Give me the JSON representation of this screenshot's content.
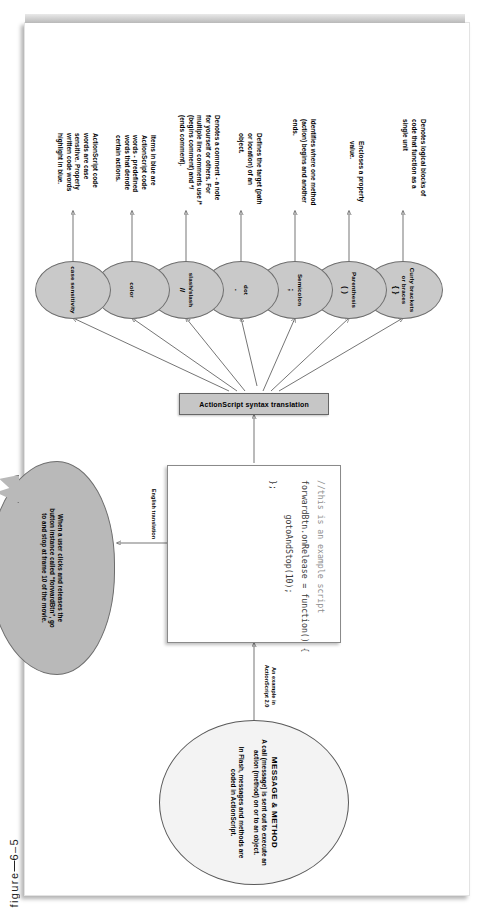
{
  "figure": {
    "caption_label": "figure",
    "caption_number": "6–5"
  },
  "source_node": {
    "title": "MESSAGE & METHOD",
    "para1": "A call (message) is sent out to execute an action (method) on or to an object.",
    "para2": "In Flash, messages and methods are coded in ActionScript."
  },
  "edges": {
    "example_label": "An example in ActionScript 2.0",
    "translation_label": "English translation"
  },
  "code_sample": {
    "lines": [
      "//this is an example script",
      "forwardBtn.onRelease = function() {",
      "       gotoAndStop(10);",
      "};"
    ]
  },
  "translation_balloon": {
    "text": "When a user clicks and releases the button instance called “forwardBtn”, go to and stop at frame 10 of the movie."
  },
  "hub": {
    "label": "ActionScript syntax translation"
  },
  "syntax_items": [
    {
      "name": "Curly brackets or braces",
      "glyph": "{ }",
      "description": "Denotes logical blocks of code that function as a single unit"
    },
    {
      "name": "Parenthesis",
      "glyph": "( )",
      "description": "Encloses a property value."
    },
    {
      "name": "Semicolon",
      "glyph": ";",
      "description": "Identifies where one method (action) begins and another ends."
    },
    {
      "name": "dot",
      "glyph": ".",
      "description": "Defines the target (path or location) of an object."
    },
    {
      "name": "slash/slash",
      "glyph": "//",
      "description": "Denotes a comment - a note for yourself or others. For multiple line comments use /* (begins comment) and */ (ends comment)."
    },
    {
      "name": "color",
      "glyph": "",
      "description": "Items in blue are ActionScript code words - predefined words that denote certain actions."
    },
    {
      "name": "case sensitivity",
      "glyph": "",
      "description": "ActionScript code words are case sensitive. Properly written code words highlight in blue."
    }
  ],
  "colors": {
    "node_fill": "#c9c9c9",
    "paper": "#ffffff",
    "stroke": "#3a3a3a"
  }
}
